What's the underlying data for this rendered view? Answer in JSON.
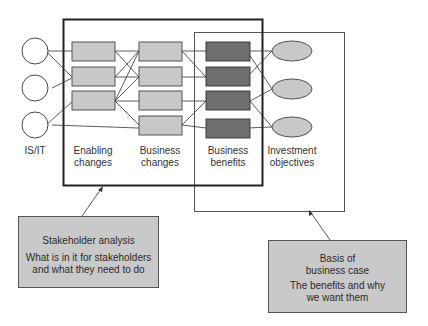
{
  "diagram": {
    "columns": {
      "is_it": {
        "label": "IS/IT",
        "count": 3
      },
      "enabling": {
        "label_line1": "Enabling",
        "label_line2": "changes",
        "count": 3
      },
      "business_changes": {
        "label_line1": "Business",
        "label_line2": "changes",
        "count": 4
      },
      "benefits": {
        "label_line1": "Business",
        "label_line2": "benefits",
        "count": 4
      },
      "objectives": {
        "label_line1": "Investment",
        "label_line2": "objectives",
        "count": 3
      }
    },
    "callouts": {
      "stakeholder": {
        "title": "Stakeholder analysis",
        "line1": "What is in it for stakeholders",
        "line2": "and what they need to do"
      },
      "business_case": {
        "title_line1": "Basis of",
        "title_line2": "business case",
        "line1": "The benefits and why",
        "line2": "we want them"
      }
    },
    "colors": {
      "light_box": "#c8c8c8",
      "dark_box": "#6e6e6e",
      "ellipse": "#c8c8c8",
      "callout": "#c9c9c9",
      "line": "#333333"
    }
  }
}
